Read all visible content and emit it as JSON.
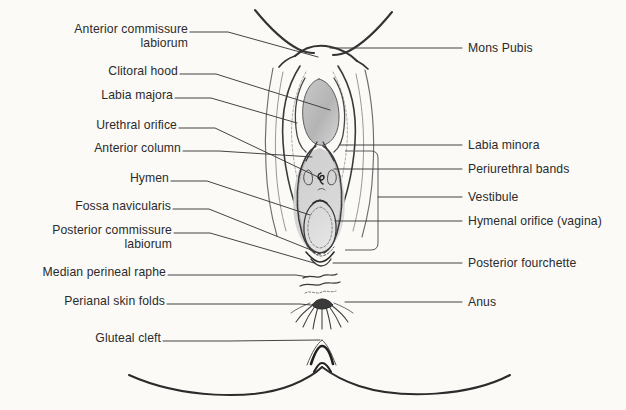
{
  "figure": {
    "background_color": "#fbfaf7",
    "ink_color": "#2b2b2b",
    "shading_color": "#b9b9b9"
  },
  "labels_left": [
    {
      "id": "anterior-commissure-labiorum",
      "line1": "Anterior commissure",
      "line2": "labiorum",
      "x_right": 188,
      "y": 28,
      "two_line": true
    },
    {
      "id": "clitoral-hood",
      "line1": "Clitoral hood",
      "line2": "",
      "x_right": 178,
      "y": 70,
      "two_line": false
    },
    {
      "id": "labia-majora",
      "line1": "Labia majora",
      "line2": "",
      "x_right": 173,
      "y": 94,
      "two_line": false
    },
    {
      "id": "urethral-orifice",
      "line1": "Urethral orifice",
      "line2": "",
      "x_right": 177,
      "y": 124,
      "two_line": false
    },
    {
      "id": "anterior-column",
      "line1": "Anterior column",
      "line2": "",
      "x_right": 181,
      "y": 147,
      "two_line": false
    },
    {
      "id": "hymen",
      "line1": "Hymen",
      "line2": "",
      "x_right": 169,
      "y": 177,
      "two_line": false
    },
    {
      "id": "fossa-navicularis",
      "line1": "Fossa navicularis",
      "line2": "",
      "x_right": 171,
      "y": 205,
      "two_line": false
    },
    {
      "id": "posterior-commissure-labiorum",
      "line1": "Posterior commissure",
      "line2": "labiorum",
      "x_right": 172,
      "y": 229,
      "two_line": true
    },
    {
      "id": "median-perineal-raphe",
      "line1": "Median perineal raphe",
      "line2": "",
      "x_right": 166,
      "y": 271,
      "two_line": false
    },
    {
      "id": "perianal-skin-folds",
      "line1": "Perianal skin folds",
      "line2": "",
      "x_right": 165,
      "y": 300,
      "two_line": false
    },
    {
      "id": "gluteal-cleft",
      "line1": "Gluteal cleft",
      "line2": "",
      "x_right": 161,
      "y": 337,
      "two_line": false
    }
  ],
  "labels_right": [
    {
      "id": "mons-pubis",
      "text": "Mons Pubis",
      "x_left": 468,
      "y": 42
    },
    {
      "id": "labia-minora",
      "text": "Labia minora",
      "x_left": 468,
      "y": 140
    },
    {
      "id": "periurethral-bands",
      "text": "Periurethral bands",
      "x_left": 468,
      "y": 163
    },
    {
      "id": "vestibule",
      "text": "Vestibule",
      "x_left": 468,
      "y": 191
    },
    {
      "id": "hymenal-orifice-vagina",
      "text": "Hymenal orifice (vagina)",
      "x_left": 468,
      "y": 215
    },
    {
      "id": "posterior-fourchette",
      "text": "Posterior fourchette",
      "x_left": 468,
      "y": 258
    },
    {
      "id": "anus",
      "text": "Anus",
      "x_left": 468,
      "y": 297
    }
  ],
  "leader_lines": {
    "count": 18,
    "style": "thin solid hairlines with short horizontal tails meeting the label text"
  },
  "anatomy_parts": [
    "mons-pubis-crease",
    "labia-majora-outline",
    "clitoral-hood-shaded-oval",
    "labia-minora-folds",
    "urethral-orifice-mark",
    "periurethral-bands",
    "vestibule-region",
    "hymenal-orifice-ring",
    "fossa-navicularis",
    "posterior-fourchette",
    "median-perineal-raphe-wavy-lines",
    "perianal-skin-folds-radiating",
    "anus-opening",
    "gluteal-cleft-peak",
    "buttock-curves"
  ]
}
